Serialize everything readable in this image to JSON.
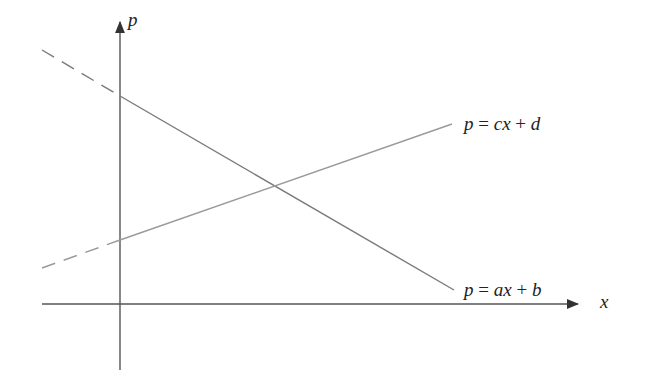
{
  "diagram": {
    "axes": {
      "x_label": "x",
      "y_label": "p",
      "color": "#555555"
    },
    "lines": [
      {
        "id": "demand",
        "label": "p = ax + b",
        "label_parts": [
          "p",
          " = ",
          "ax",
          " + ",
          "b"
        ],
        "color": "#7a7a7a",
        "slope": "negative",
        "dashed_segment": "left of p-axis"
      },
      {
        "id": "supply",
        "label": "p = cx + d",
        "label_parts": [
          "p",
          " = ",
          "cx",
          " + ",
          "d"
        ],
        "color": "#9a9a9a",
        "slope": "positive",
        "dashed_segment": "left of p-axis"
      }
    ]
  }
}
